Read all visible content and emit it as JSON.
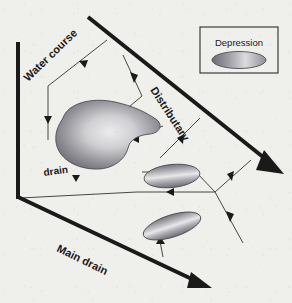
{
  "figure": {
    "type": "schematic-diagram",
    "background_color": "#efefec",
    "ink_color": "#1a1a1a"
  },
  "labels": {
    "water_course": "Water course",
    "distributary": "Distributary",
    "drain": "drain",
    "main_drain": "Main drain"
  },
  "legend": {
    "title": "Depression",
    "box": {
      "x": 200,
      "y": 27,
      "width": 78,
      "height": 46
    },
    "symbol": {
      "shape": "ellipse",
      "cx": 239,
      "cy": 58,
      "rx": 27,
      "ry": 9
    }
  },
  "colors": {
    "depression_dark": "#6f6f74",
    "depression_light": "#e9e9ea",
    "line": "#1a1a1a",
    "thin_line": "#3a3a3a",
    "legend_border": "#2a2a2a",
    "paper": "#efefec"
  },
  "channels": [
    {
      "name": "distributary",
      "label": "Distributary",
      "from": [
        88,
        17
      ],
      "to": [
        281,
        171
      ],
      "weight": "thick",
      "arrow": "solid-triangle-end"
    },
    {
      "name": "main-drain",
      "label": "Main drain",
      "from": [
        20,
        198
      ],
      "to": [
        207,
        286
      ],
      "weight": "thick",
      "arrow": "solid-triangle-end"
    },
    {
      "name": "left-boundary",
      "label": "",
      "from": [
        18,
        42
      ],
      "to": [
        18,
        198
      ],
      "weight": "thick",
      "arrow": "none"
    },
    {
      "name": "water-course",
      "label": "Water course",
      "from": [
        107,
        40
      ],
      "to": [
        48,
        140
      ],
      "weight": "thin",
      "arrow": "mid-triangles"
    }
  ],
  "depressions": [
    {
      "name": "large-bean-depression",
      "shape": "bean",
      "cx": 108,
      "cy": 137,
      "rx": 52,
      "ry": 33
    },
    {
      "name": "middle-ellipse-depression",
      "shape": "ellipse",
      "cx": 172,
      "cy": 176,
      "rx": 28,
      "ry": 11,
      "rotation_deg": -6
    },
    {
      "name": "lower-ellipse-depression",
      "shape": "ellipse",
      "cx": 172,
      "cy": 226,
      "rx": 29,
      "ry": 11,
      "rotation_deg": -18
    }
  ],
  "flow_arrows": [
    {
      "name": "flow-branch-top",
      "from": [
        107,
        40
      ],
      "to": [
        78,
        53
      ]
    },
    {
      "name": "flow-watercourse-down",
      "from": [
        48,
        86
      ],
      "to": [
        48,
        140
      ]
    },
    {
      "name": "flow-branch-to-bean-upper",
      "from": [
        142,
        96
      ],
      "to": [
        92,
        138
      ]
    },
    {
      "name": "flow-branch-to-bean-right",
      "from": [
        163,
        126
      ],
      "to": [
        120,
        142
      ]
    },
    {
      "name": "flow-distributary-to-middle",
      "from": [
        200,
        118
      ],
      "to": [
        163,
        155
      ]
    },
    {
      "name": "flow-into-middle-ellipse",
      "from": [
        196,
        172
      ],
      "to": [
        140,
        172
      ]
    },
    {
      "name": "flow-junction-to-left",
      "from": [
        215,
        192
      ],
      "to": [
        137,
        192
      ]
    },
    {
      "name": "flow-junction-lower",
      "from": [
        240,
        206
      ],
      "to": [
        215,
        192
      ]
    },
    {
      "name": "flow-junction-upper",
      "from": [
        245,
        165
      ],
      "to": [
        215,
        192
      ]
    },
    {
      "name": "flow-down-right",
      "from": [
        215,
        192
      ],
      "to": [
        240,
        240
      ]
    },
    {
      "name": "flow-main-drain-to-lower",
      "from": [
        160,
        255
      ],
      "to": [
        160,
        238
      ]
    },
    {
      "name": "flow-drain-line",
      "from": [
        20,
        198
      ],
      "to": [
        137,
        192
      ]
    }
  ]
}
